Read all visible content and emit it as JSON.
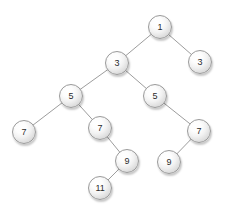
{
  "figure": {
    "kind": "binary-tree-diagram",
    "width": 230,
    "height": 217,
    "background_color": "#ffffff",
    "node_border_color": "#9a9a9a",
    "node_fill_color": "#e6e6e6",
    "node_text_color": "#2b2b2b",
    "edge_color": "#9d9d9d",
    "node_diameter": 24
  },
  "tree": {
    "nodes": [
      {
        "id": "n1",
        "label": "1",
        "x": 160,
        "y": 27,
        "depth": 0
      },
      {
        "id": "n2",
        "label": "3",
        "x": 117,
        "y": 63,
        "depth": 1
      },
      {
        "id": "n3",
        "label": "3",
        "x": 200,
        "y": 62,
        "depth": 1
      },
      {
        "id": "n4",
        "label": "5",
        "x": 71,
        "y": 96,
        "depth": 2
      },
      {
        "id": "n5",
        "label": "5",
        "x": 155,
        "y": 96,
        "depth": 2
      },
      {
        "id": "n6",
        "label": "7",
        "x": 24,
        "y": 132,
        "depth": 3
      },
      {
        "id": "n7",
        "label": "7",
        "x": 100,
        "y": 128,
        "depth": 3
      },
      {
        "id": "n8",
        "label": "7",
        "x": 199,
        "y": 131,
        "depth": 3
      },
      {
        "id": "n9",
        "label": "9",
        "x": 127,
        "y": 161,
        "depth": 4
      },
      {
        "id": "n10",
        "label": "9",
        "x": 169,
        "y": 162,
        "depth": 4
      },
      {
        "id": "n11",
        "label": "11",
        "x": 100,
        "y": 188,
        "depth": 5
      }
    ],
    "edges": [
      {
        "from": "n1",
        "to": "n2"
      },
      {
        "from": "n1",
        "to": "n3"
      },
      {
        "from": "n2",
        "to": "n4"
      },
      {
        "from": "n2",
        "to": "n5"
      },
      {
        "from": "n4",
        "to": "n6"
      },
      {
        "from": "n4",
        "to": "n7"
      },
      {
        "from": "n5",
        "to": "n8"
      },
      {
        "from": "n7",
        "to": "n9"
      },
      {
        "from": "n8",
        "to": "n10"
      },
      {
        "from": "n9",
        "to": "n11"
      }
    ]
  }
}
